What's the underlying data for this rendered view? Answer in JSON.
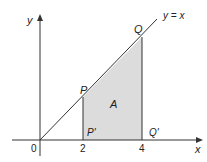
{
  "diagram": {
    "axes": {
      "x_label": "x",
      "y_label": "y",
      "origin_label": "0"
    },
    "line_label": "y = x",
    "ticks": {
      "x2": "2",
      "x4": "4"
    },
    "points": {
      "P": "P",
      "Q": "Q",
      "P_prime": "P'",
      "Q_prime": "Q'"
    },
    "region_label": "A",
    "colors": {
      "shade": "#dcdcdc",
      "stroke": "#333333"
    }
  }
}
